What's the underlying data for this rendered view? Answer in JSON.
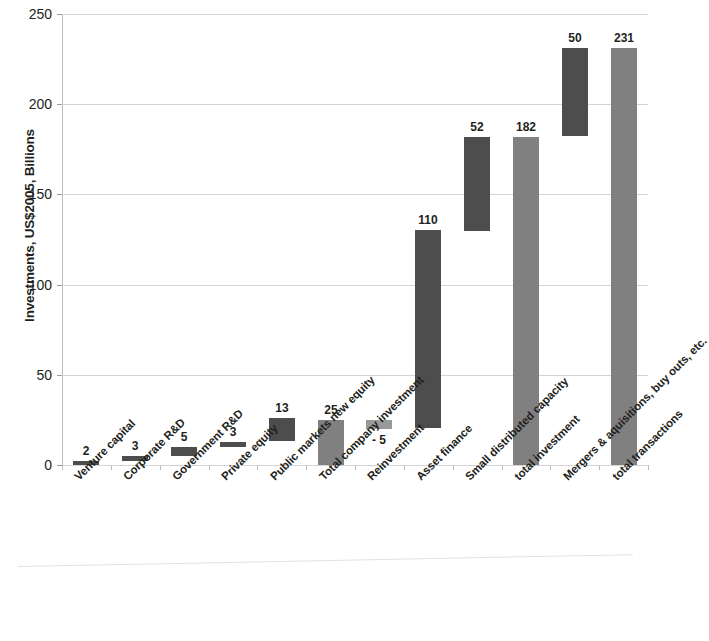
{
  "chart_data": {
    "type": "bar",
    "subtype": "waterfall",
    "title": "",
    "xlabel": "",
    "ylabel": "Investments, US$2005, Billions",
    "ylim": [
      0,
      250
    ],
    "yticks": [
      0,
      50,
      100,
      150,
      200,
      250
    ],
    "ytick_labels": [
      "0",
      "50",
      "100",
      "150",
      "200",
      "250"
    ],
    "grid": true,
    "legend": "none",
    "categories": [
      "Venture capital",
      "Corporate R&D",
      "Government R&D",
      "Private equity",
      "Public markets new equity",
      "Total company investment",
      "Reinvestment",
      "Asset finance",
      "Small distributed capacity",
      "total investment",
      "Mergers & aquisitions, buy outs, etc.",
      "total transactions"
    ],
    "values": [
      2,
      3,
      5,
      3,
      13,
      25,
      -5,
      110,
      52,
      182,
      50,
      231
    ],
    "value_labels": [
      "2",
      "3",
      "5",
      "3",
      "13",
      "25",
      "- 5",
      "110",
      "52",
      "182",
      "50",
      "231"
    ],
    "bars": [
      {
        "category": "Venture capital",
        "value": 2,
        "label": "2",
        "base": 0,
        "top": 2,
        "kind": "step",
        "color": "#4d4d4d",
        "label_position": "above"
      },
      {
        "category": "Corporate R&D",
        "value": 3,
        "label": "3",
        "base": 2,
        "top": 5,
        "kind": "step",
        "color": "#4d4d4d",
        "label_position": "above"
      },
      {
        "category": "Government R&D",
        "value": 5,
        "label": "5",
        "base": 5,
        "top": 10,
        "kind": "step",
        "color": "#4d4d4d",
        "label_position": "above"
      },
      {
        "category": "Private equity",
        "value": 3,
        "label": "3",
        "base": 10,
        "top": 13,
        "kind": "step",
        "color": "#4d4d4d",
        "label_position": "above"
      },
      {
        "category": "Public markets new equity",
        "value": 13,
        "label": "13",
        "base": 13,
        "top": 26,
        "kind": "step",
        "color": "#4d4d4d",
        "label_position": "above"
      },
      {
        "category": "Total company investment",
        "value": 25,
        "label": "25",
        "base": 0,
        "top": 25,
        "kind": "total",
        "color": "#808080",
        "label_position": "above"
      },
      {
        "category": "Reinvestment",
        "value": -5,
        "label": "- 5",
        "base": 20,
        "top": 25,
        "kind": "step",
        "color": "#999999",
        "label_position": "below"
      },
      {
        "category": "Asset finance",
        "value": 110,
        "label": "110",
        "base": 20,
        "top": 130,
        "kind": "step",
        "color": "#4d4d4d",
        "label_position": "above"
      },
      {
        "category": "Small distributed capacity",
        "value": 52,
        "label": "52",
        "base": 130,
        "top": 182,
        "kind": "step",
        "color": "#4d4d4d",
        "label_position": "above"
      },
      {
        "category": "total investment",
        "value": 182,
        "label": "182",
        "base": 0,
        "top": 182,
        "kind": "total",
        "color": "#808080",
        "label_position": "above"
      },
      {
        "category": "Mergers & aquisitions, buy outs, etc.",
        "value": 50,
        "label": "50",
        "base": 182,
        "top": 231,
        "kind": "step",
        "color": "#4d4d4d",
        "label_position": "above"
      },
      {
        "category": "total transactions",
        "value": 231,
        "label": "231",
        "base": 0,
        "top": 231,
        "kind": "total",
        "color": "#808080",
        "label_position": "above"
      }
    ],
    "colors": {
      "step_bar": "#4d4d4d",
      "total_bar": "#808080",
      "negative_bar": "#999999",
      "gridline": "#d4d4d4",
      "axis": "#bdbdbd",
      "text": "#231f20",
      "background": "#ffffff"
    }
  }
}
